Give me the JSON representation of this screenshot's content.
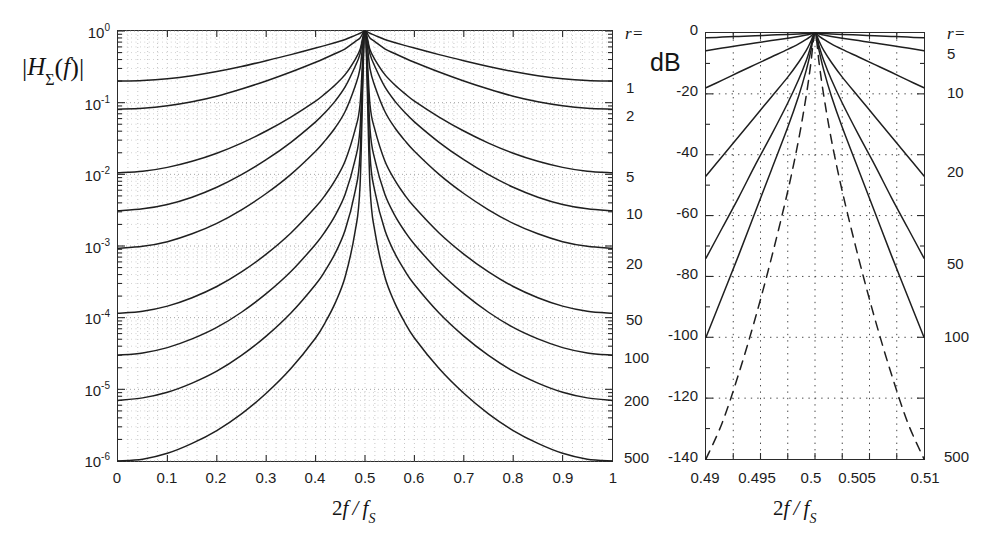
{
  "figure": {
    "panels": [
      {
        "id": "left",
        "ylabel": "|HΣ(f)|",
        "xlabel": "2f/fS",
        "r_header": "r =",
        "y_ticks": [
          "10^0",
          "10^-1",
          "10^-2",
          "10^-3",
          "10^-4",
          "10^-5",
          "10^-6"
        ],
        "x_ticks": [
          "0",
          "0.1",
          "0.2",
          "0.3",
          "0.4",
          "0.5",
          "0.6",
          "0.7",
          "0.8",
          "0.9",
          "1"
        ],
        "r_labels": [
          "1",
          "2",
          "5",
          "10",
          "20",
          "50",
          "100",
          "200",
          "500"
        ]
      },
      {
        "id": "right",
        "ylabel": "dB",
        "xlabel": "2f/fS",
        "r_header": "r =",
        "y_ticks": [
          "0",
          "-20",
          "-40",
          "-60",
          "-80",
          "-100",
          "-120",
          "-140"
        ],
        "x_ticks": [
          "0.49",
          "0.495",
          "0.5",
          "0.505",
          "0.51"
        ],
        "r_labels": [
          "5",
          "10",
          "20",
          "50",
          "100",
          "500"
        ]
      }
    ]
  },
  "chart_data": [
    {
      "type": "line",
      "id": "left-panel",
      "title": "",
      "xlabel": "2f/fS",
      "ylabel": "|HΣ(f)|",
      "xlim": [
        0,
        1
      ],
      "ylim": [
        1e-06,
        1
      ],
      "yscale": "log",
      "xscale": "linear",
      "grid": true,
      "grid_style": "dotted",
      "legend": "right-edge r values",
      "x": [
        0,
        0.05,
        0.1,
        0.15,
        0.2,
        0.25,
        0.3,
        0.35,
        0.4,
        0.42,
        0.44,
        0.46,
        0.48,
        0.49,
        0.5,
        0.51,
        0.52,
        0.54,
        0.56,
        0.58,
        0.6,
        0.65,
        0.7,
        0.75,
        0.8,
        0.85,
        0.9,
        0.95,
        1.0
      ],
      "series": [
        {
          "name": "r = 1",
          "r": 1,
          "values": [
            0.2,
            0.204,
            0.216,
            0.238,
            0.272,
            0.32,
            0.385,
            0.468,
            0.578,
            0.63,
            0.69,
            0.76,
            0.87,
            0.93,
            1.0,
            0.93,
            0.87,
            0.76,
            0.69,
            0.63,
            0.578,
            0.468,
            0.385,
            0.32,
            0.272,
            0.238,
            0.216,
            0.204,
            0.2
          ]
        },
        {
          "name": "r = 2",
          "r": 2,
          "values": [
            0.081,
            0.0835,
            0.0905,
            0.103,
            0.123,
            0.155,
            0.201,
            0.268,
            0.367,
            0.42,
            0.485,
            0.565,
            0.71,
            0.8,
            1.0,
            0.8,
            0.71,
            0.565,
            0.485,
            0.42,
            0.367,
            0.268,
            0.201,
            0.155,
            0.123,
            0.103,
            0.0905,
            0.0835,
            0.081
          ]
        },
        {
          "name": "r = 5",
          "r": 5,
          "values": [
            0.0105,
            0.011,
            0.0125,
            0.0152,
            0.0197,
            0.0273,
            0.0402,
            0.063,
            0.105,
            0.135,
            0.178,
            0.248,
            0.4,
            0.55,
            1.0,
            0.55,
            0.4,
            0.248,
            0.178,
            0.135,
            0.105,
            0.063,
            0.0402,
            0.0273,
            0.0197,
            0.0152,
            0.0125,
            0.011,
            0.0105
          ]
        },
        {
          "name": "r = 10",
          "r": 10,
          "values": [
            0.0031,
            0.0033,
            0.0038,
            0.0048,
            0.0066,
            0.0099,
            0.016,
            0.028,
            0.054,
            0.074,
            0.106,
            0.167,
            0.32,
            0.48,
            1.0,
            0.48,
            0.32,
            0.167,
            0.106,
            0.074,
            0.054,
            0.028,
            0.016,
            0.0099,
            0.0066,
            0.0048,
            0.0038,
            0.0033,
            0.0031
          ]
        },
        {
          "name": "r = 20",
          "r": 20,
          "values": [
            0.00093,
            0.00099,
            0.00115,
            0.00148,
            0.00207,
            0.0032,
            0.0054,
            0.01,
            0.021,
            0.03,
            0.045,
            0.076,
            0.17,
            0.3,
            1.0,
            0.3,
            0.17,
            0.076,
            0.045,
            0.03,
            0.021,
            0.01,
            0.0054,
            0.0032,
            0.00207,
            0.00148,
            0.00115,
            0.00099,
            0.00093
          ]
        },
        {
          "name": "r = 50",
          "r": 50,
          "values": [
            0.000115,
            0.000123,
            0.000145,
            0.00019,
            0.000272,
            0.000435,
            0.00077,
            0.00152,
            0.0035,
            0.0052,
            0.0084,
            0.0155,
            0.042,
            0.095,
            1.0,
            0.095,
            0.042,
            0.0155,
            0.0084,
            0.0052,
            0.0035,
            0.00152,
            0.00077,
            0.000435,
            0.000272,
            0.00019,
            0.000145,
            0.000123,
            0.000115
          ]
        },
        {
          "name": "r = 100",
          "r": 100,
          "values": [
            3e-05,
            3.22e-05,
            3.82e-05,
            5.05e-05,
            7.3e-05,
            0.000119,
            0.000216,
            0.00044,
            0.00106,
            0.00162,
            0.0027,
            0.0053,
            0.016,
            0.044,
            1.0,
            0.044,
            0.016,
            0.0053,
            0.0027,
            0.00162,
            0.00106,
            0.00044,
            0.000216,
            0.000119,
            7.3e-05,
            5.05e-05,
            3.82e-05,
            3.22e-05,
            3e-05
          ]
        },
        {
          "name": "r = 200",
          "r": 200,
          "values": [
            7e-06,
            7.6e-06,
            9.1e-06,
            1.22e-05,
            1.79e-05,
            2.97e-05,
            5.52e-05,
            0.000116,
            0.00029,
            0.00046,
            0.0008,
            0.00168,
            0.0058,
            0.019,
            1.0,
            0.019,
            0.0058,
            0.00168,
            0.0008,
            0.00046,
            0.00029,
            0.000116,
            5.52e-05,
            2.97e-05,
            1.79e-05,
            1.22e-05,
            9.1e-06,
            7.6e-06,
            7e-06
          ]
        },
        {
          "name": "r = 500",
          "r": 500,
          "values": [
            1e-06,
            1.06e-06,
            1.28e-06,
            1.76e-06,
            2.66e-06,
            4.55e-06,
            8.8e-06,
            1.95e-05,
            5.2e-05,
            8.7e-05,
            0.000162,
            0.000375,
            0.0016,
            0.007,
            1.0,
            0.007,
            0.0016,
            0.000375,
            0.000162,
            8.7e-05,
            5.2e-05,
            1.95e-05,
            8.8e-06,
            4.55e-06,
            2.66e-06,
            1.76e-06,
            1.28e-06,
            1.06e-06,
            1e-06
          ]
        }
      ]
    },
    {
      "type": "line",
      "id": "right-panel",
      "title": "",
      "xlabel": "2f/fS",
      "ylabel": "dB",
      "xlim": [
        0.49,
        0.51
      ],
      "ylim": [
        -140,
        0
      ],
      "yscale": "linear",
      "xscale": "linear",
      "grid": true,
      "grid_style": "dotted",
      "legend": "right-edge r values",
      "x": [
        0.49,
        0.4915,
        0.493,
        0.4945,
        0.496,
        0.4975,
        0.4985,
        0.4992,
        0.4996,
        0.5,
        0.5004,
        0.5008,
        0.5015,
        0.5025,
        0.504,
        0.5055,
        0.507,
        0.5085,
        0.51
      ],
      "series": [
        {
          "name": "r = 5",
          "r": 5,
          "style": "solid",
          "values": [
            -1.6,
            -1.35,
            -1.12,
            -0.9,
            -0.68,
            -0.46,
            -0.3,
            -0.18,
            -0.09,
            0,
            -0.09,
            -0.18,
            -0.3,
            -0.46,
            -0.68,
            -0.9,
            -1.12,
            -1.35,
            -1.6
          ]
        },
        {
          "name": "r = 10",
          "r": 10,
          "style": "solid",
          "values": [
            -5.8,
            -4.95,
            -4.1,
            -3.3,
            -2.5,
            -1.7,
            -1.12,
            -0.66,
            -0.34,
            0,
            -0.34,
            -0.66,
            -1.12,
            -1.7,
            -2.5,
            -3.3,
            -4.1,
            -4.95,
            -5.8
          ]
        },
        {
          "name": "r = 20",
          "r": 20,
          "style": "solid",
          "values": [
            -18.0,
            -15.5,
            -12.9,
            -10.4,
            -7.9,
            -5.4,
            -3.6,
            -2.1,
            -1.1,
            0,
            -1.1,
            -2.1,
            -3.6,
            -5.4,
            -7.9,
            -10.4,
            -12.9,
            -15.5,
            -18.0
          ]
        },
        {
          "name": "r = 50",
          "r": 50,
          "style": "solid",
          "values": [
            -47.0,
            -40.5,
            -34.0,
            -27.5,
            -21.0,
            -14.5,
            -9.6,
            -5.7,
            -2.9,
            0,
            -2.9,
            -5.7,
            -9.6,
            -14.5,
            -21.0,
            -27.5,
            -34.0,
            -40.5,
            -47.0
          ]
        },
        {
          "name": "r = 100",
          "r": 100,
          "style": "solid",
          "values": [
            -74.0,
            -64.0,
            -54.0,
            -43.5,
            -33.5,
            -23.0,
            -15.3,
            -9.0,
            -4.6,
            0,
            -4.6,
            -9.0,
            -15.3,
            -23.0,
            -33.5,
            -43.5,
            -54.0,
            -64.0,
            -74.0
          ]
        },
        {
          "name": "r = 200",
          "r": 200,
          "style": "solid",
          "values": [
            -100.0,
            -86.5,
            -73.0,
            -59.0,
            -45.0,
            -31.0,
            -20.7,
            -12.2,
            -6.2,
            0,
            -6.2,
            -12.2,
            -20.7,
            -31.0,
            -45.0,
            -59.0,
            -73.0,
            -86.5,
            -100.0
          ]
        },
        {
          "name": "r = 500",
          "r": 500,
          "style": "dashed",
          "values": [
            -140.0,
            -128.0,
            -112.0,
            -94.0,
            -74.0,
            -52.0,
            -35.0,
            -20.5,
            -10.5,
            0,
            -10.5,
            -20.5,
            -35.0,
            -52.0,
            -74.0,
            -94.0,
            -112.0,
            -128.0,
            -140.0
          ]
        }
      ]
    }
  ]
}
